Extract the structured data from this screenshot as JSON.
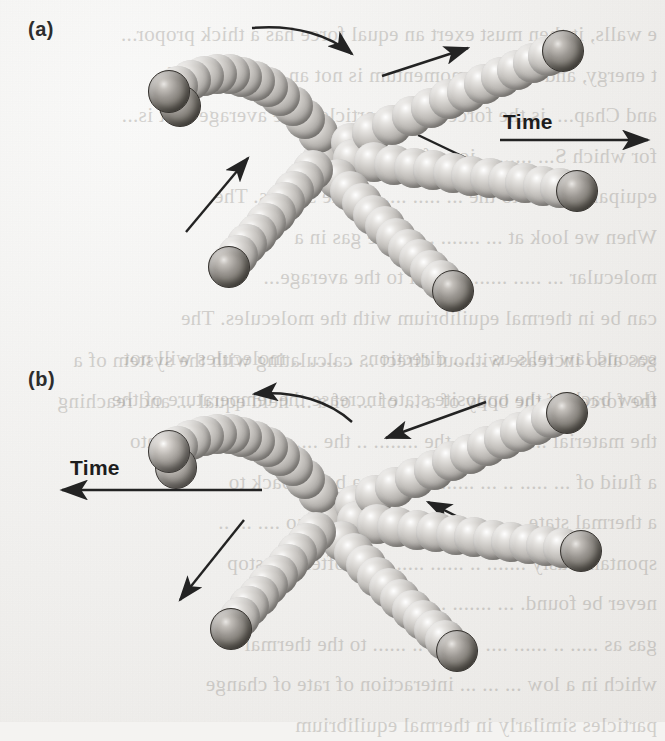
{
  "figure": {
    "caption_labels": {
      "panel_a": "(a)",
      "panel_b": "(b)"
    },
    "time_label": "Time",
    "background_color": "#f4f3f1",
    "ink_color": "#2d2d2d",
    "sphere_light_color": "#c9c6c2",
    "sphere_dark_color": "#5f5b55"
  },
  "background_text": {
    "panel_a_lines": "e walls, it then must exert an equal force has a thick propor...\nt energy, and that the momentum is not an energy transf...\nand Chap...  is the force of the particles, the average v. It is...\nfor which S... ..........ion of O molecules\nequipartition is to the ... ..... ..... of the strains. The\nWhen we look at ... ....... .. of the gas in a\nmolecular ... ..... ........ equal to the average...\ncan be in thermal equilibrium with the molecules. The\nsecond law tells us ...... directions .. ..... .. molecules will not\nflow back in the opposite state increase the temperature of the",
    "panel_b_lines": "gas also increase without direct ... calculating with the system of a\nthe forces of the body of a ... of ... of a ... held equal ... and reaching\nthe material ... ......... .. the ........ .. the ....... .. converted into\na fluid of ... ..... .. ... ...... .. ...... .. a body, back to\na thermal state ... ..... .. .. and similarity so .... ... ..\nspontaneously ....... .. ...... ..... ....... often we stop\nnever be found. ... ....... ... .......\ngas as ..... .. ...... .... .. ...... .. ...... to the thermal\nwhich in a low ... ... ... interaction of rate of change\nparticles similarly in thermal equilibrium"
  },
  "panels": [
    {
      "id": "a",
      "label": "(a)",
      "time_arrow": {
        "label": "Time",
        "direction": "right",
        "x": 500,
        "y": 125,
        "length": 150
      },
      "description": "Forward-in-time collision of a diatomic molecule with single atoms",
      "trails": [
        {
          "name": "diatomic-incoming-curved",
          "beads": 13,
          "head": "dark-pair",
          "direction": "toward-upper-left"
        },
        {
          "name": "atom-scatter-upper-right",
          "beads": 14,
          "head": "dark",
          "direction": "upper-right"
        },
        {
          "name": "atom-scatter-right",
          "beads": 14,
          "head": "dark",
          "direction": "right-down"
        },
        {
          "name": "atom-scatter-lower-right",
          "beads": 12,
          "head": "dark",
          "direction": "lower-right"
        },
        {
          "name": "atom-incoming-lower-left",
          "beads": 11,
          "head": "dark",
          "direction": "lower-left"
        }
      ],
      "motion_arrows": [
        {
          "name": "curved-rotation-arrow",
          "style": "curved",
          "points": "right-down"
        },
        {
          "name": "arrow-upper-right",
          "style": "straight",
          "points": "upper-right"
        },
        {
          "name": "arrow-right-down",
          "style": "straight",
          "points": "lower-right"
        },
        {
          "name": "arrow-lower-right",
          "style": "straight",
          "points": "lower-right"
        },
        {
          "name": "arrow-lower-left",
          "style": "straight",
          "points": "upper-right"
        }
      ]
    },
    {
      "id": "b",
      "label": "(b)",
      "time_arrow": {
        "label": "Time",
        "direction": "left",
        "x": 30,
        "y": 145,
        "length": 150
      },
      "description": "The same collision played backwards; every motion arrow is reversed",
      "trails": [
        {
          "name": "diatomic-outgoing-curved",
          "beads": 13,
          "head": "light-pair",
          "direction": "toward-upper-left"
        },
        {
          "name": "atom-incoming-upper-right",
          "beads": 14,
          "head": "dark",
          "direction": "upper-right"
        },
        {
          "name": "atom-incoming-right",
          "beads": 14,
          "head": "dark",
          "direction": "right-down"
        },
        {
          "name": "atom-incoming-lower-right",
          "beads": 12,
          "head": "dark",
          "direction": "lower-right"
        },
        {
          "name": "atom-outgoing-lower-left",
          "beads": 11,
          "head": "dark",
          "direction": "lower-left"
        }
      ],
      "motion_arrows": [
        {
          "name": "curved-rotation-arrow",
          "style": "curved",
          "points": "left-up"
        },
        {
          "name": "arrow-upper-right",
          "style": "straight",
          "points": "lower-left"
        },
        {
          "name": "arrow-right-down",
          "style": "straight",
          "points": "upper-left"
        },
        {
          "name": "arrow-lower-right",
          "style": "straight",
          "points": "upper-left"
        },
        {
          "name": "arrow-lower-left",
          "style": "straight",
          "points": "lower-left"
        }
      ]
    }
  ]
}
